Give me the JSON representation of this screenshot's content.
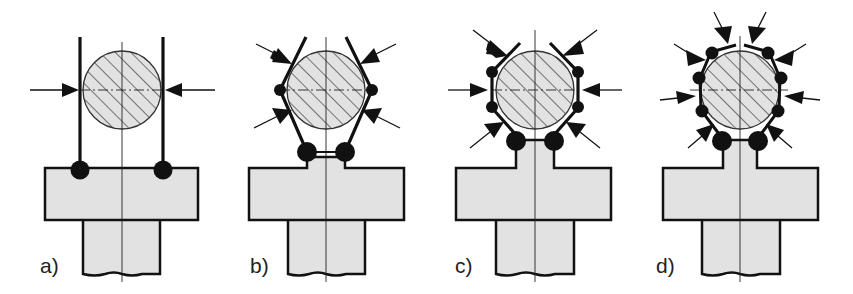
{
  "figure": {
    "colors": {
      "fill": "#e2e2e2",
      "stroke": "#111111",
      "background": "#ffffff"
    },
    "panels": [
      {
        "label": "a)",
        "contact_arrows": 2,
        "finger_segments": "straight parallel jaws",
        "joints": 2
      },
      {
        "label": "b)",
        "contact_arrows": 4,
        "finger_segments": "two-link V fingers",
        "joints": 4
      },
      {
        "label": "c)",
        "contact_arrows": 6,
        "finger_segments": "three-link fingers",
        "joints": 6
      },
      {
        "label": "d)",
        "contact_arrows": 8,
        "finger_segments": "multi-link enveloping fingers",
        "joints": 10
      }
    ]
  }
}
